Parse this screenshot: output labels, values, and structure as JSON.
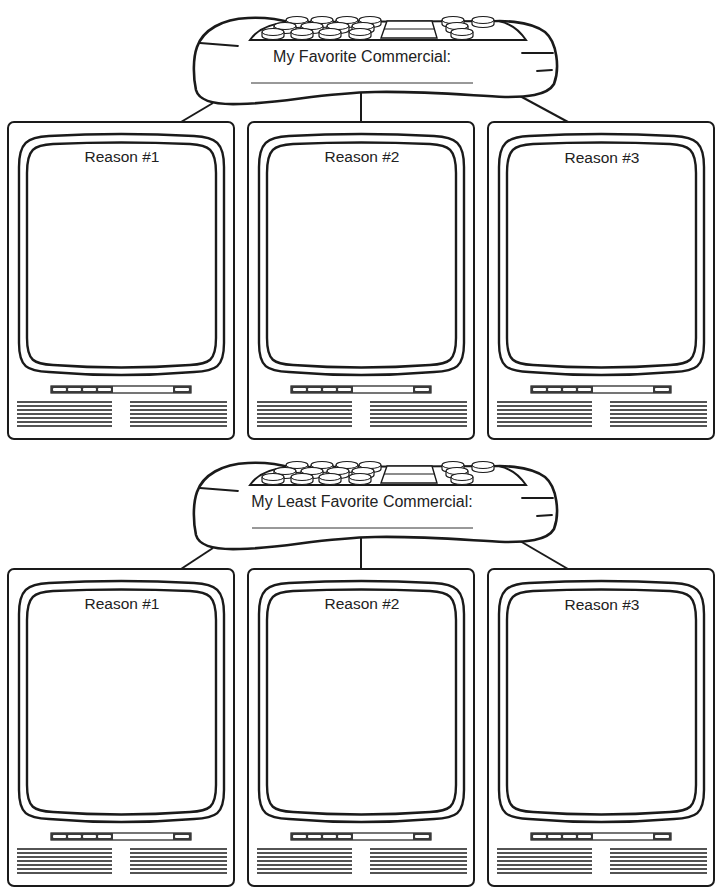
{
  "worksheet": {
    "sections": [
      {
        "prompt": "My Favorite Commercial:",
        "reasons": [
          "Reason #1",
          "Reason #2",
          "Reason #3"
        ]
      },
      {
        "prompt": "My Least Favorite Commercial:",
        "reasons": [
          "Reason #1",
          "Reason #2",
          "Reason #3"
        ]
      }
    ]
  },
  "icons": {
    "remote": "remote-control-icon",
    "tv": "television-icon"
  },
  "colors": {
    "ink": "#1a1a1a",
    "paper": "#ffffff"
  }
}
